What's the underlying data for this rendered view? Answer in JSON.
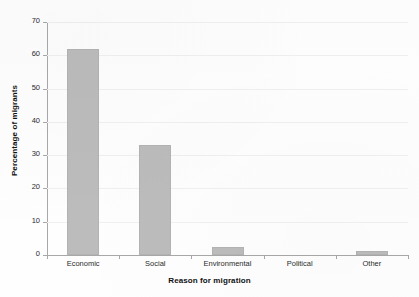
{
  "chart_data": {
    "type": "bar",
    "title": "",
    "subtitle": "",
    "xlabel": "Reason for migration",
    "ylabel": "Percentage of migrants",
    "categories": [
      "Economic",
      "Social",
      "Environmental",
      "Political",
      "Other"
    ],
    "values": [
      62,
      33,
      2.5,
      0,
      1.2
    ],
    "series": [
      {
        "name": "Percentage of migrants",
        "values": [
          62,
          33,
          2.5,
          0,
          1.2
        ]
      }
    ],
    "ylim": [
      0,
      70
    ],
    "y_ticks": [
      0,
      10,
      20,
      30,
      40,
      50,
      60,
      70
    ],
    "y_tick_labels": [
      "0",
      "10",
      "20",
      "30",
      "40",
      "50",
      "60",
      "70"
    ],
    "grid": true,
    "grid_axis": "y",
    "legend": false,
    "legend_position": "none",
    "bar_color": "#bcbcbc",
    "bar_edge_color": "#b3b3b3",
    "background_color": "#fefefe",
    "axis_color": "#a8a8a8",
    "gridline_color": "#f0f0f0",
    "annotations": []
  }
}
